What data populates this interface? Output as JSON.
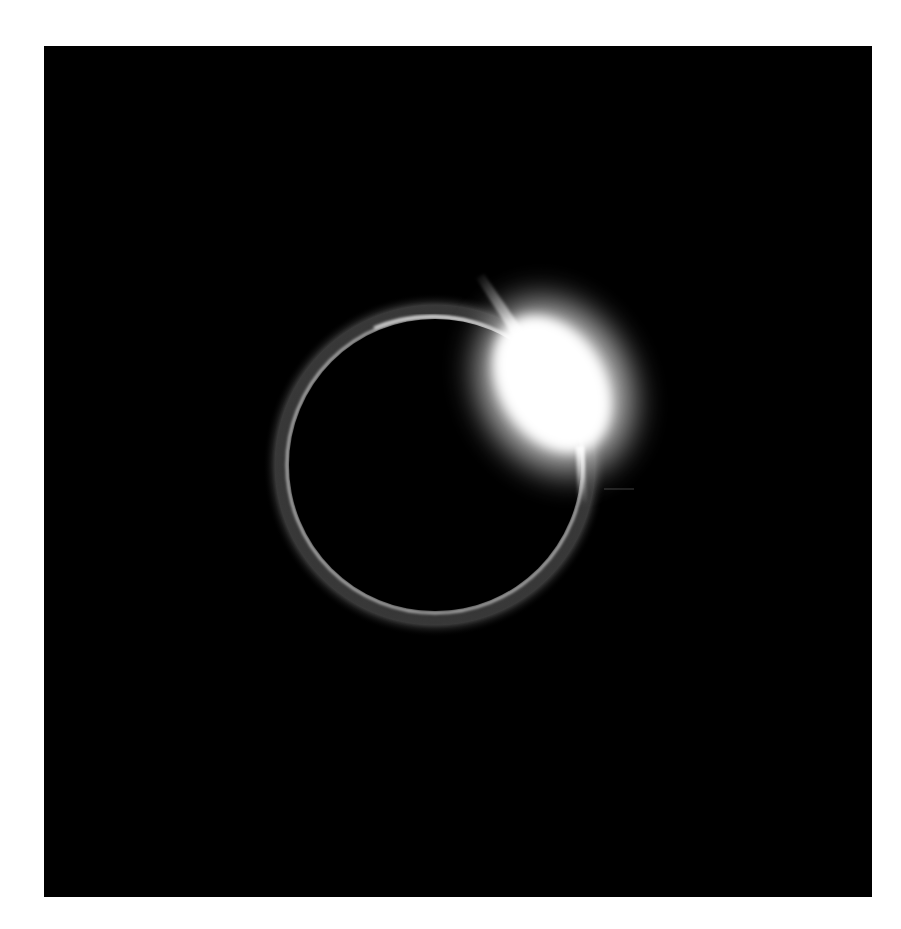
{
  "image": {
    "subject": "Total solar eclipse - diamond ring effect",
    "background_color": "#ffffff",
    "frame_color": "#000000",
    "frame": {
      "x": 44,
      "y": 46,
      "width": 828,
      "height": 851
    },
    "ring": {
      "cx": 391,
      "cy": 419,
      "r": 148,
      "color": "#bdbdbd"
    },
    "flare": {
      "cx": 511,
      "cy": 340,
      "rx": 62,
      "ry": 82,
      "rotate": -30,
      "color": "#ffffff"
    }
  }
}
